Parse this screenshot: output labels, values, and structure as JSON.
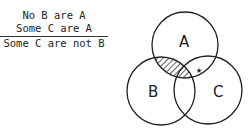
{
  "syllogism": {
    "premises": [
      "No B are A",
      "Some C are A"
    ],
    "conclusion": "Some C are not B"
  },
  "venn": {
    "circles": [
      {
        "label": "A",
        "cx": 185,
        "cy": 45,
        "r": 33
      },
      {
        "label": "B",
        "cx": 161,
        "cy": 91,
        "r": 34
      },
      {
        "label": "C",
        "cx": 208,
        "cy": 90,
        "r": 34
      }
    ],
    "shaded_region": "A∩B",
    "marker": "★",
    "marker_region": "A∩C (outside B)"
  }
}
